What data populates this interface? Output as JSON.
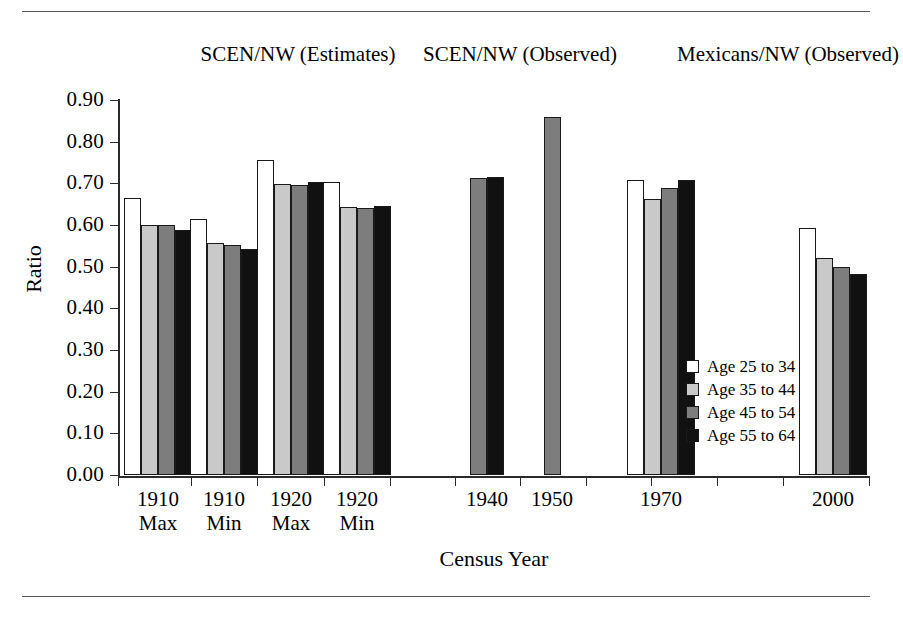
{
  "figure": {
    "y_axis_title": "Ratio",
    "x_axis_title": "Census Year",
    "panels": [
      {
        "line1": "SCEN/NW",
        "line2": "(Estimates)"
      },
      {
        "line1": "SCEN/NW",
        "line2": "(Observed)"
      },
      {
        "line1": "Mexicans/NW",
        "line2": "(Observed)"
      }
    ]
  },
  "legend": {
    "entries": [
      {
        "label": "Age 25 to 34",
        "color": "#ffffff"
      },
      {
        "label": "Age 35 to 44",
        "color": "#c9c9c9"
      },
      {
        "label": "Age 45 to 54",
        "color": "#7d7d7d"
      },
      {
        "label": "Age 55 to 64",
        "color": "#111111"
      }
    ]
  },
  "chart_data": {
    "type": "bar",
    "title": "",
    "xlabel": "Census Year",
    "ylabel": "Ratio",
    "ylim": [
      0.0,
      0.9
    ],
    "grid": false,
    "legend_position": "inside-right",
    "ytick_labels": [
      "0.90",
      "0.80",
      "0.70",
      "0.60",
      "0.50",
      "0.40",
      "0.30",
      "0.20",
      "0.10",
      "0.00"
    ],
    "ytick_values": [
      0.9,
      0.8,
      0.7,
      0.6,
      0.5,
      0.4,
      0.3,
      0.2,
      0.1,
      0.0
    ],
    "categories": [
      {
        "line1": "1910",
        "line2": "Max"
      },
      {
        "line1": "1910",
        "line2": "Min"
      },
      {
        "line1": "1920",
        "line2": "Max"
      },
      {
        "line1": "1920",
        "line2": "Min"
      },
      {
        "line1": "1940",
        "line2": ""
      },
      {
        "line1": "1950",
        "line2": ""
      },
      {
        "line1": "1970",
        "line2": ""
      },
      {
        "line1": "2000",
        "line2": ""
      }
    ],
    "series": [
      {
        "name": "Age 25 to 34",
        "color": "#ffffff",
        "values": [
          0.665,
          0.615,
          0.757,
          0.703,
          null,
          null,
          0.708,
          0.593
        ]
      },
      {
        "name": "Age 35 to 44",
        "color": "#c9c9c9",
        "values": [
          0.601,
          0.556,
          0.699,
          0.643,
          null,
          null,
          0.663,
          0.521
        ]
      },
      {
        "name": "Age 45 to 54",
        "color": "#7d7d7d",
        "values": [
          0.6,
          0.552,
          0.697,
          0.64,
          0.713,
          0.859,
          0.689,
          0.5
        ]
      },
      {
        "name": "Age 55 to 64",
        "color": "#111111",
        "values": [
          0.589,
          0.542,
          0.702,
          0.646,
          0.714,
          null,
          0.708,
          0.482
        ]
      }
    ]
  }
}
